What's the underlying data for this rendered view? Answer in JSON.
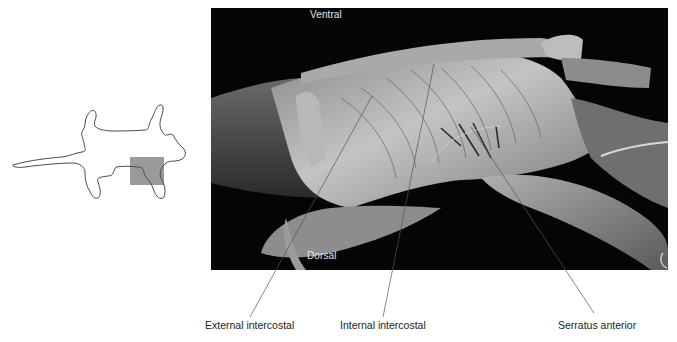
{
  "figure": {
    "orientation_diagram": {
      "description": "cat-outline-ventral-view",
      "highlight_color": "#9a9a9a",
      "outline_color": "#4a4a4a"
    },
    "photo": {
      "background": "#050505",
      "labels": {
        "top": "Ventral",
        "bottom": "Dorsal"
      }
    },
    "callouts": [
      {
        "label": "External intercostal"
      },
      {
        "label": "Internal intercostal"
      },
      {
        "label": "Serratus anterior"
      }
    ],
    "leader_line_color": "#555555"
  }
}
